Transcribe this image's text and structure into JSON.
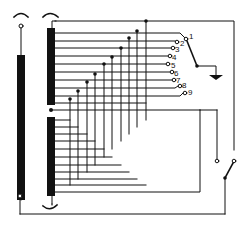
{
  "diagram": {
    "type": "circuit-schematic",
    "colors": {
      "ink": "#111111",
      "background": "#ffffff"
    },
    "components": {
      "primary_core": {
        "label": "core-bar-left"
      },
      "tapped_winding": {
        "label": "tapped-winding"
      },
      "rotary_switch": {
        "positions": [
          "1",
          "2",
          "3",
          "4",
          "5",
          "6",
          "7",
          "8",
          "9"
        ],
        "selected": "1"
      },
      "ground": {
        "label": "ground"
      },
      "power_switch": {
        "state": "open"
      }
    }
  }
}
